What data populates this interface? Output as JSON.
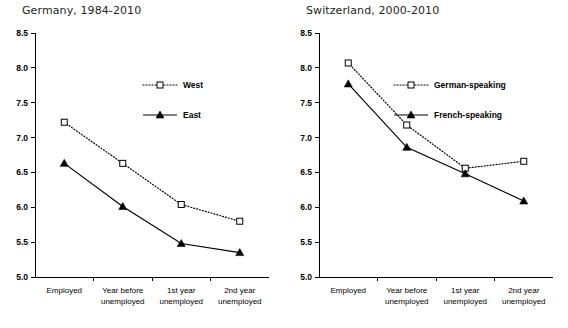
{
  "chart_data": [
    {
      "type": "line",
      "title": "Germany, 1984-2010",
      "xlabel": "",
      "ylabel": "",
      "ylim": [
        5.0,
        8.5
      ],
      "yticks": [
        "5.0",
        "5.5",
        "6.0",
        "6.5",
        "7.0",
        "7.5",
        "8.0",
        "8.5"
      ],
      "grid": false,
      "legend_position": "upper right",
      "categories": [
        "Employed",
        "Year before unemployed",
        "1st year unemployed",
        "2nd year unemployed"
      ],
      "category_lines": [
        [
          "Employed",
          ""
        ],
        [
          "Year before",
          "unemployed"
        ],
        [
          "1st year",
          "unemployed"
        ],
        [
          "2nd year",
          "unemployed"
        ]
      ],
      "series": [
        {
          "name": "West",
          "values": [
            7.22,
            6.63,
            6.04,
            5.8
          ],
          "marker": "open-square",
          "line": "dotted"
        },
        {
          "name": "East",
          "values": [
            6.63,
            6.01,
            5.48,
            5.35
          ],
          "marker": "filled-triangle",
          "line": "solid"
        }
      ]
    },
    {
      "type": "line",
      "title": "Switzerland, 2000-2010",
      "xlabel": "",
      "ylabel": "",
      "ylim": [
        5.0,
        8.5
      ],
      "yticks": [
        "5.0",
        "5.5",
        "6.0",
        "6.5",
        "7.0",
        "7.5",
        "8.0",
        "8.5"
      ],
      "grid": false,
      "legend_position": "upper right",
      "categories": [
        "Employed",
        "Year before unemployed",
        "1st year unemployed",
        "2nd year unemployed"
      ],
      "category_lines": [
        [
          "Employed",
          ""
        ],
        [
          "Year before",
          "unemployed"
        ],
        [
          "1st year",
          "unemployed"
        ],
        [
          "2nd year",
          "unemployed"
        ]
      ],
      "series": [
        {
          "name": "German-speaking",
          "values": [
            8.07,
            7.18,
            6.56,
            6.66
          ],
          "marker": "open-square",
          "line": "dotted"
        },
        {
          "name": "French-speaking",
          "values": [
            7.77,
            6.86,
            6.48,
            6.09
          ],
          "marker": "filled-triangle",
          "line": "solid"
        }
      ]
    }
  ],
  "colors": {
    "ink": "#000000",
    "title": "#231f20",
    "background": "#ffffff"
  }
}
